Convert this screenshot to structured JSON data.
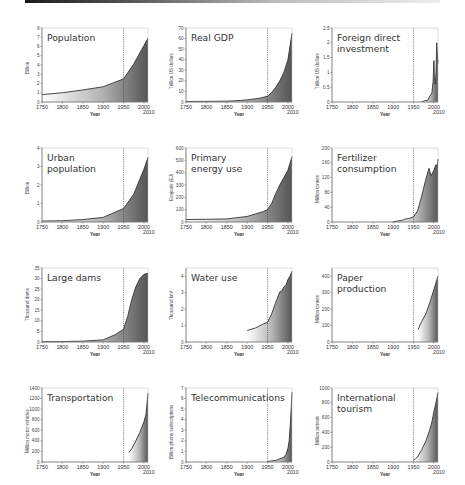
{
  "figure": {
    "xlabel": "Year",
    "end_year_label": "2010",
    "x_ticks": [
      "1750",
      "1800",
      "1850",
      "1900",
      "1950",
      "2000"
    ],
    "reference_line_year": 1950,
    "colors": {
      "line": "#333333",
      "fill_dark": "#555555",
      "fill_light": "#ffffff",
      "frame": "#555555",
      "ref_line": "#444444"
    }
  },
  "chart_data": [
    {
      "type": "area",
      "title": "Population",
      "ylabel": "Billion",
      "ylim": [
        0,
        8
      ],
      "yticks": [
        "0",
        "1",
        "2",
        "3",
        "4",
        "5",
        "6",
        "7",
        "8"
      ],
      "x": [
        1750,
        1800,
        1850,
        1900,
        1950,
        1975,
        2000,
        2010
      ],
      "values": [
        0.8,
        1.0,
        1.3,
        1.65,
        2.5,
        4.1,
        6.1,
        6.9
      ]
    },
    {
      "type": "area",
      "title": "Real GDP",
      "ylabel": "Trillion US dollars",
      "ylim": [
        0,
        70
      ],
      "yticks": [
        "0",
        "10",
        "20",
        "30",
        "40",
        "50",
        "60",
        "70"
      ],
      "x": [
        1750,
        1800,
        1850,
        1870,
        1900,
        1930,
        1950,
        1960,
        1970,
        1980,
        1990,
        2000,
        2010
      ],
      "values": [
        0.5,
        0.6,
        0.8,
        1.1,
        2.0,
        3.5,
        5.5,
        9,
        14,
        20,
        28,
        40,
        65
      ]
    },
    {
      "type": "area",
      "title": "Foreign direct\ninvestment",
      "ylabel": "Trillion US dollars",
      "ylim": [
        0,
        2.5
      ],
      "yticks": [
        "0",
        "0.5",
        "1",
        "1.5",
        "2",
        "2.5"
      ],
      "x": [
        1970,
        1980,
        1985,
        1990,
        1995,
        1998,
        2000,
        2001,
        2003,
        2005,
        2007,
        2008,
        2010
      ],
      "values": [
        0.01,
        0.05,
        0.06,
        0.2,
        0.3,
        0.7,
        1.4,
        0.8,
        0.6,
        0.95,
        2.0,
        1.7,
        1.3
      ]
    },
    {
      "type": "area",
      "title": "Urban\npopulation",
      "ylabel": "Billion",
      "ylim": [
        0,
        4
      ],
      "yticks": [
        "0",
        "1",
        "2",
        "3",
        "4"
      ],
      "x": [
        1750,
        1800,
        1850,
        1900,
        1950,
        1975,
        2000,
        2010
      ],
      "values": [
        0.05,
        0.07,
        0.13,
        0.25,
        0.73,
        1.5,
        2.85,
        3.5
      ]
    },
    {
      "type": "area",
      "title": "Primary\nenergy use",
      "ylabel": "Exajoule (EJ)",
      "ylim": [
        0,
        600
      ],
      "yticks": [
        "0",
        "100",
        "200",
        "300",
        "400",
        "500",
        "600"
      ],
      "x": [
        1750,
        1800,
        1850,
        1900,
        1920,
        1940,
        1950,
        1960,
        1970,
        1980,
        1990,
        2000,
        2010
      ],
      "values": [
        20,
        22,
        25,
        45,
        65,
        85,
        100,
        150,
        230,
        300,
        360,
        420,
        530
      ]
    },
    {
      "type": "area",
      "title": "Fertilizer\nconsumption",
      "ylabel": "Million tonnes",
      "ylim": [
        0,
        200
      ],
      "yticks": [
        "0",
        "40",
        "80",
        "120",
        "160",
        "200"
      ],
      "x": [
        1900,
        1920,
        1930,
        1940,
        1950,
        1960,
        1970,
        1980,
        1988,
        1993,
        2000,
        2005,
        2008,
        2010
      ],
      "values": [
        1,
        4,
        8,
        10,
        14,
        30,
        70,
        115,
        145,
        125,
        140,
        155,
        150,
        170
      ]
    },
    {
      "type": "area",
      "title": "Large dams",
      "ylabel": "Thousand dams",
      "ylim": [
        0,
        35
      ],
      "yticks": [
        "0",
        "5",
        "10",
        "15",
        "20",
        "25",
        "30",
        "35"
      ],
      "x": [
        1750,
        1800,
        1850,
        1900,
        1930,
        1950,
        1960,
        1970,
        1980,
        1990,
        2000,
        2010
      ],
      "values": [
        0.1,
        0.2,
        0.4,
        1.0,
        3.5,
        6,
        12,
        20,
        26,
        30,
        32,
        32.5
      ]
    },
    {
      "type": "area",
      "title": "Water use",
      "ylabel": "Thousand km³",
      "ylim": [
        0,
        4.5
      ],
      "yticks": [
        "0",
        "1",
        "2",
        "3",
        "4"
      ],
      "x": [
        1900,
        1920,
        1940,
        1950,
        1960,
        1970,
        1980,
        1985,
        1990,
        1995,
        2000,
        2005,
        2010
      ],
      "values": [
        0.7,
        0.85,
        1.1,
        1.2,
        1.7,
        2.4,
        3.05,
        3.1,
        3.35,
        3.45,
        3.8,
        4.0,
        4.3
      ]
    },
    {
      "type": "area",
      "title": "Paper\nproduction",
      "ylabel": "Million tonnes",
      "ylim": [
        0,
        450
      ],
      "yticks": [
        "0",
        "100",
        "200",
        "300",
        "400"
      ],
      "x": [
        1961,
        1970,
        1980,
        1990,
        2000,
        2005,
        2010
      ],
      "values": [
        75,
        125,
        170,
        240,
        320,
        360,
        400
      ]
    },
    {
      "type": "area",
      "title": "Transportation",
      "ylabel": "Million motor vehicles",
      "ylim": [
        0,
        1400
      ],
      "yticks": [
        "0",
        "200",
        "400",
        "600",
        "800",
        "1000",
        "1200",
        "1400"
      ],
      "x": [
        1963,
        1970,
        1980,
        1990,
        2000,
        2005,
        2010
      ],
      "values": [
        180,
        250,
        400,
        560,
        760,
        900,
        1300
      ]
    },
    {
      "type": "area",
      "title": "Telecommunications",
      "ylabel": "Billion phone subscriptions",
      "ylim": [
        0,
        7
      ],
      "yticks": [
        "0",
        "1",
        "2",
        "3",
        "4",
        "5",
        "6",
        "7"
      ],
      "x": [
        1950,
        1970,
        1990,
        1995,
        2000,
        2003,
        2006,
        2008,
        2010
      ],
      "values": [
        0.05,
        0.15,
        0.45,
        0.7,
        1.3,
        2.0,
        3.6,
        5.0,
        6.6
      ]
    },
    {
      "type": "area",
      "title": "International\ntourism",
      "ylabel": "Million arrivals",
      "ylim": [
        0,
        1000
      ],
      "yticks": [
        "0",
        "200",
        "400",
        "600",
        "800",
        "1000"
      ],
      "x": [
        1950,
        1955,
        1960,
        1970,
        1980,
        1990,
        1995,
        2000,
        2005,
        2010
      ],
      "values": [
        25,
        45,
        70,
        165,
        280,
        440,
        540,
        680,
        800,
        940
      ]
    }
  ]
}
